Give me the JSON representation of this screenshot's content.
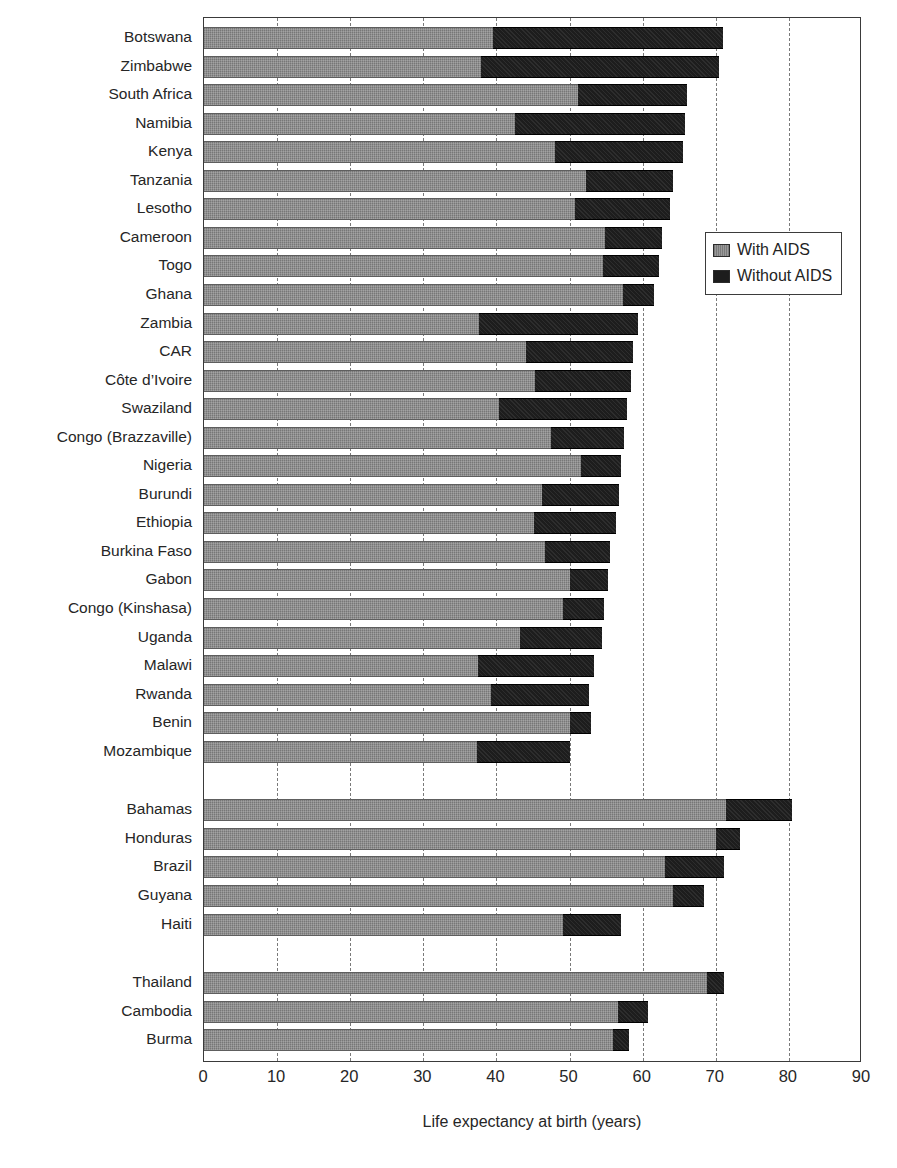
{
  "chart_data": {
    "type": "bar",
    "orientation": "horizontal",
    "stacked_style": "overlay",
    "title": "",
    "xlabel": "Life expectancy at birth (years)",
    "ylabel": "",
    "xlim": [
      0,
      90
    ],
    "xticks": [
      0,
      10,
      20,
      30,
      40,
      50,
      60,
      70,
      80,
      90
    ],
    "xtick_labels": [
      "0",
      "10",
      "20",
      "30",
      "40",
      "50",
      "60",
      "70",
      "80",
      "90"
    ],
    "grid": "vertical-dashed",
    "legend_position": "inside-right-upper",
    "legend": [
      {
        "name": "With AIDS",
        "color": "#848484"
      },
      {
        "name": "Without AIDS",
        "color": "#1d1d1d"
      }
    ],
    "series": [
      {
        "name": "With AIDS",
        "color": "#848484"
      },
      {
        "name": "Without AIDS",
        "color": "#1d1d1d"
      }
    ],
    "groups": [
      {
        "name": "Sub-Saharan Africa",
        "rows": [
          {
            "category": "Botswana",
            "with_aids": 39.5,
            "without_aids": 71.0
          },
          {
            "category": "Zimbabwe",
            "with_aids": 37.9,
            "without_aids": 70.4
          },
          {
            "category": "South Africa",
            "with_aids": 51.1,
            "without_aids": 66.1
          },
          {
            "category": "Namibia",
            "with_aids": 42.5,
            "without_aids": 65.8
          },
          {
            "category": "Kenya",
            "with_aids": 48.0,
            "without_aids": 65.5
          },
          {
            "category": "Tanzania",
            "with_aids": 52.3,
            "without_aids": 64.2
          },
          {
            "category": "Lesotho",
            "with_aids": 50.8,
            "without_aids": 63.7
          },
          {
            "category": "Cameroon",
            "with_aids": 54.8,
            "without_aids": 62.6
          },
          {
            "category": "Togo",
            "with_aids": 54.6,
            "without_aids": 62.3
          },
          {
            "category": "Ghana",
            "with_aids": 57.3,
            "without_aids": 61.5
          },
          {
            "category": "Zambia",
            "with_aids": 37.6,
            "without_aids": 59.4
          },
          {
            "category": "CAR",
            "with_aids": 44.1,
            "without_aids": 58.7
          },
          {
            "category": "Côte d’Ivoire",
            "with_aids": 45.3,
            "without_aids": 58.4
          },
          {
            "category": "Swaziland",
            "with_aids": 40.4,
            "without_aids": 57.9
          },
          {
            "category": "Congo (Brazzaville)",
            "with_aids": 47.5,
            "without_aids": 57.4
          },
          {
            "category": "Nigeria",
            "with_aids": 51.6,
            "without_aids": 57.0
          },
          {
            "category": "Burundi",
            "with_aids": 46.2,
            "without_aids": 56.8
          },
          {
            "category": "Ethiopia",
            "with_aids": 45.2,
            "without_aids": 56.3
          },
          {
            "category": "Burkina Faso",
            "with_aids": 46.7,
            "without_aids": 55.6
          },
          {
            "category": "Gabon",
            "with_aids": 50.1,
            "without_aids": 55.3
          },
          {
            "category": "Congo (Kinshasa)",
            "with_aids": 49.1,
            "without_aids": 54.7
          },
          {
            "category": "Uganda",
            "with_aids": 43.2,
            "without_aids": 54.4
          },
          {
            "category": "Malawi",
            "with_aids": 37.5,
            "without_aids": 53.4
          },
          {
            "category": "Rwanda",
            "with_aids": 39.3,
            "without_aids": 52.7
          },
          {
            "category": "Benin",
            "with_aids": 50.0,
            "without_aids": 52.9
          },
          {
            "category": "Mozambique",
            "with_aids": 37.4,
            "without_aids": 50.1
          }
        ]
      },
      {
        "name": "Latin America and Caribbean",
        "rows": [
          {
            "category": "Bahamas",
            "with_aids": 71.4,
            "without_aids": 80.4
          },
          {
            "category": "Honduras",
            "with_aids": 70.0,
            "without_aids": 73.3
          },
          {
            "category": "Brazil",
            "with_aids": 63.0,
            "without_aids": 71.1
          },
          {
            "category": "Guyana",
            "with_aids": 64.2,
            "without_aids": 68.4
          },
          {
            "category": "Haiti",
            "with_aids": 49.1,
            "without_aids": 57.0
          }
        ]
      },
      {
        "name": "Asia",
        "rows": [
          {
            "category": "Thailand",
            "with_aids": 68.8,
            "without_aids": 71.1
          },
          {
            "category": "Cambodia",
            "with_aids": 56.6,
            "without_aids": 60.7
          },
          {
            "category": "Burma",
            "with_aids": 56.0,
            "without_aids": 58.1
          }
        ]
      }
    ]
  }
}
